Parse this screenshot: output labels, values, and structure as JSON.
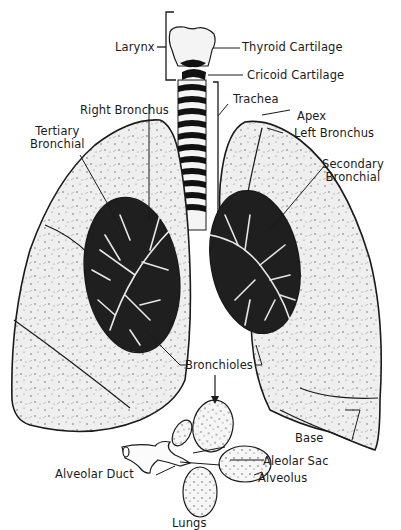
{
  "figure": {
    "caption": "Lungs",
    "colors": {
      "ink": "#1a1a1a",
      "paper": "#ffffff",
      "tissue": "#e6e6e6",
      "bronchial_bg": "#1f1f1f"
    }
  },
  "labels": {
    "larynx": "Larynx",
    "thyroid_cartilage": "Thyroid Cartilage",
    "cricoid_cartilage": "Cricoid Cartilage",
    "trachea": "Trachea",
    "right_bronchus": "Right Bronchus",
    "tertiary_bronchial": "Tertiary\nBronchial",
    "apex": "Apex",
    "left_bronchus": "Left Bronchus",
    "secondary_bronchial": "Secondary\nBronchial",
    "bronchioles": "Bronchioles",
    "base": "Base",
    "alveolar_duct": "Alveolar Duct",
    "aleolar_sac": "Aleolar Sac",
    "alveolus": "Alveolus"
  }
}
